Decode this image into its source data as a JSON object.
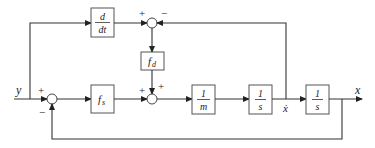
{
  "diagram": {
    "type": "block-diagram",
    "signals": {
      "input": "y",
      "output": "x",
      "velocity": "ẋ"
    },
    "blocks": [
      {
        "id": "deriv",
        "num": "d",
        "den": "dt"
      },
      {
        "id": "fd",
        "label": "f",
        "sub": "d"
      },
      {
        "id": "fs",
        "label": "f",
        "sub": "s"
      },
      {
        "id": "inv_m",
        "num": "1",
        "den": "m"
      },
      {
        "id": "int1",
        "num": "1",
        "den": "s"
      },
      {
        "id": "int2",
        "num": "1",
        "den": "s"
      }
    ],
    "summing_junctions": [
      {
        "id": "sum_input",
        "signs": {
          "left": "+",
          "bottom": "−"
        }
      },
      {
        "id": "sum_damping",
        "signs": {
          "left": "+",
          "right": "−"
        }
      },
      {
        "id": "sum_force",
        "signs": {
          "left": "+",
          "top": "+"
        }
      }
    ],
    "colors": {
      "line": "#333333",
      "box_border": "#555555",
      "background": "#ffffff"
    }
  }
}
